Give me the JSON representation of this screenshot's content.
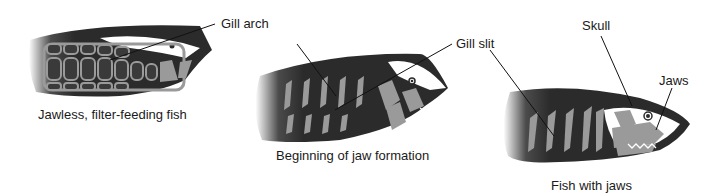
{
  "figures": [
    {
      "id": "jawless",
      "caption": "Jawless, filter-feeding fish",
      "labels": [
        {
          "text": "Gill arch"
        }
      ]
    },
    {
      "id": "beginning",
      "caption": "Beginning of jaw formation",
      "labels": [
        {
          "text": "Gill slit"
        }
      ]
    },
    {
      "id": "jawed",
      "caption": "Fish with jaws",
      "labels": [
        {
          "text": "Skull"
        },
        {
          "text": "Jaws"
        }
      ]
    }
  ],
  "colors": {
    "body_dark": "#2b2b2b",
    "cartilage_gray": "#9a9a9a",
    "skull_white": "#ffffff",
    "leader_line": "#111111",
    "text": "#1a1a1a"
  }
}
